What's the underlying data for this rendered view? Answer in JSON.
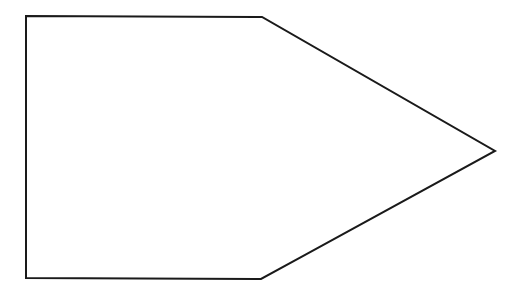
{
  "diagram": {
    "shape": "pentagon-arrow",
    "background": "#ffffff",
    "stroke": "#1a1a1a",
    "stroke_width": 2,
    "fill": "#ffffff",
    "points": "26,16 262,17 495,151 261,279 26,278"
  }
}
